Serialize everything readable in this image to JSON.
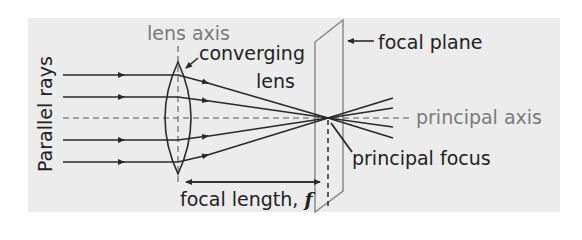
{
  "diagram": {
    "labels": {
      "lens_axis": "lens axis",
      "converging_lens_line1": "converging",
      "converging_lens_line2": "lens",
      "focal_plane": "focal plane",
      "principal_axis": "principal axis",
      "principal_focus": "principal focus",
      "focal_length": "focal length, ",
      "focal_length_symbol": "f",
      "parallel_rays": "Parallel rays"
    },
    "colors": {
      "background_panel": "#ececec",
      "ray_line": "#2a2a2a",
      "axis_dashed": "#8a8a8a",
      "focal_plane": "#8a8a8a",
      "grey_text": "#7a7a7a",
      "dark_text": "#222222"
    },
    "rays": {
      "count": 4,
      "incoming_y": [
        75,
        97,
        140,
        162
      ],
      "lens_x": 178,
      "focus_point": [
        328,
        118
      ]
    }
  }
}
